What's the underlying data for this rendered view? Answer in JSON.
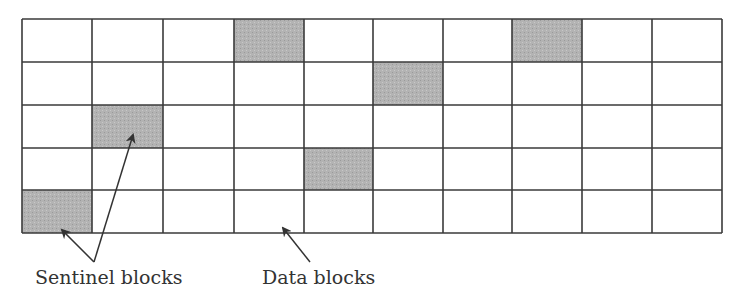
{
  "diagram": {
    "grid": {
      "rows": 5,
      "cols": 10,
      "x_lines": [
        22,
        92,
        163,
        234,
        304,
        373,
        443,
        512,
        582,
        652,
        722
      ],
      "y_lines": [
        19,
        62,
        105,
        148,
        190,
        233
      ],
      "line_color": "#3a3a3a",
      "empty_fill": "#ffffff",
      "sentinel_fill": "#b3b3b3",
      "sentinel_cells": [
        {
          "row": 0,
          "col": 3
        },
        {
          "row": 0,
          "col": 7
        },
        {
          "row": 1,
          "col": 5
        },
        {
          "row": 2,
          "col": 1
        },
        {
          "row": 3,
          "col": 4
        },
        {
          "row": 4,
          "col": 0
        }
      ]
    },
    "labels": {
      "sentinel": "Sentinel blocks",
      "data": "Data blocks"
    },
    "arrows": [
      {
        "name": "sentinel-arrow-1",
        "from": [
          94,
          262
        ],
        "to": [
          62,
          230
        ]
      },
      {
        "name": "sentinel-arrow-2",
        "from": [
          94,
          262
        ],
        "to": [
          133,
          135
        ]
      },
      {
        "name": "data-arrow",
        "from": [
          310,
          262
        ],
        "to": [
          283,
          228
        ]
      }
    ]
  }
}
